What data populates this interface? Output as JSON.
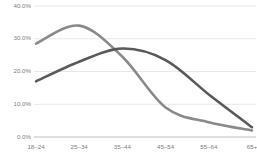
{
  "chart_data": {
    "type": "line",
    "title": "",
    "subtitle": "",
    "xlabel": "",
    "ylabel": "",
    "categories": [
      "18–24",
      "25–34",
      "35–44",
      "45–54",
      "55–64",
      "65+"
    ],
    "series": [
      {
        "name": "Series 1",
        "color": "#8a8a8a",
        "values": [
          28.5,
          34.0,
          24.5,
          9.0,
          4.5,
          2.0
        ]
      },
      {
        "name": "Series 2",
        "color": "#595959",
        "values": [
          17.0,
          23.0,
          27.0,
          23.5,
          13.0,
          3.0
        ]
      }
    ],
    "ylim": [
      0,
      40
    ],
    "yticks": [
      0,
      10,
      20,
      30,
      40
    ],
    "ytick_labels": [
      "0.0%",
      "10.0%",
      "20.0%",
      "30.0%",
      "40.0%"
    ],
    "grid": true,
    "grid_color": "#e2e2e2",
    "axis_color": "#bfbfbf",
    "legend": false,
    "legend_position": "none",
    "markers": false,
    "smoothing": "spline",
    "background": "#ffffff",
    "tick_label_color": "#808080"
  }
}
